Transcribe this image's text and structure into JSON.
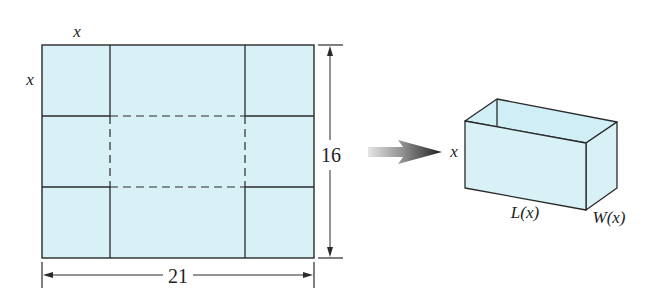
{
  "figure": {
    "colors": {
      "fill": "#d8f1f7",
      "stroke": "#2a2a2a",
      "background": "#ffffff"
    },
    "sheet": {
      "corner_label_top": "x",
      "corner_label_left": "x",
      "height_label": "16",
      "width_label": "21"
    },
    "arrow": {
      "label": "fold-into"
    },
    "box": {
      "height_label": "x",
      "length_label": "L(x)",
      "width_label": "W(x)"
    }
  }
}
